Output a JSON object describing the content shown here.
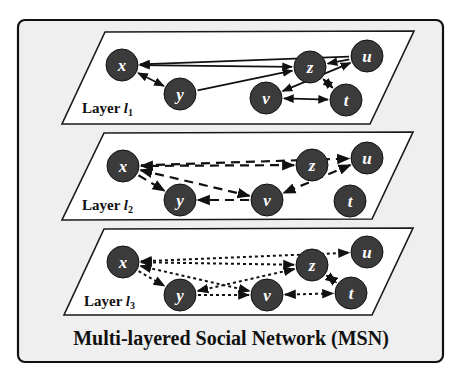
{
  "title": "Multi-layered Social Network (MSN)",
  "colors": {
    "node_fill": "#3b3b3b",
    "frame_fill": "#efefef",
    "plane_fill": "#ffffff",
    "stroke": "#111111"
  },
  "layers": [
    {
      "label_prefix": "Layer ",
      "label_var": "l",
      "label_sub": "1",
      "line_style": "solid",
      "plane": [
        [
          105,
          32
        ],
        [
          414,
          31
        ],
        [
          370,
          124
        ],
        [
          62,
          124
        ]
      ],
      "label_pos": [
        82,
        113
      ],
      "nodes": [
        {
          "id": "x",
          "cx": 122,
          "cy": 65
        },
        {
          "id": "y",
          "cx": 180,
          "cy": 94
        },
        {
          "id": "z",
          "cx": 310,
          "cy": 67
        },
        {
          "id": "u",
          "cx": 367,
          "cy": 56
        },
        {
          "id": "v",
          "cx": 266,
          "cy": 98
        },
        {
          "id": "t",
          "cx": 346,
          "cy": 100
        }
      ],
      "edges": [
        {
          "from": "u",
          "to": "x",
          "dir": "to"
        },
        {
          "from": "x",
          "to": "z",
          "dir": "both"
        },
        {
          "from": "x",
          "to": "y",
          "dir": "both"
        },
        {
          "from": "y",
          "to": "z",
          "dir": "to"
        },
        {
          "from": "u",
          "to": "z",
          "dir": "to"
        },
        {
          "from": "z",
          "to": "t",
          "dir": "both"
        },
        {
          "from": "v",
          "to": "u",
          "dir": "both"
        },
        {
          "from": "v",
          "to": "t",
          "dir": "both"
        }
      ]
    },
    {
      "label_prefix": "Layer ",
      "label_var": "l",
      "label_sub": "2",
      "line_style": "dashed",
      "plane": [
        [
          104,
          133
        ],
        [
          413,
          132
        ],
        [
          372,
          219
        ],
        [
          62,
          220
        ]
      ],
      "label_pos": [
        82,
        210
      ],
      "nodes": [
        {
          "id": "x",
          "cx": 123,
          "cy": 166
        },
        {
          "id": "y",
          "cx": 180,
          "cy": 200
        },
        {
          "id": "z",
          "cx": 312,
          "cy": 165
        },
        {
          "id": "u",
          "cx": 367,
          "cy": 158
        },
        {
          "id": "v",
          "cx": 267,
          "cy": 200
        },
        {
          "id": "t",
          "cx": 350,
          "cy": 201
        }
      ],
      "edges": [
        {
          "from": "x",
          "to": "u",
          "dir": "to"
        },
        {
          "from": "z",
          "to": "x",
          "dir": "both"
        },
        {
          "from": "x",
          "to": "v",
          "dir": "both"
        },
        {
          "from": "x",
          "to": "y",
          "dir": "to"
        },
        {
          "from": "v",
          "to": "y",
          "dir": "to"
        },
        {
          "from": "u",
          "to": "v",
          "dir": "both"
        }
      ]
    },
    {
      "label_prefix": "Layer ",
      "label_var": "l",
      "label_sub": "3",
      "line_style": "dotted",
      "plane": [
        [
          104,
          229
        ],
        [
          413,
          228
        ],
        [
          372,
          315
        ],
        [
          64,
          315
        ]
      ],
      "label_pos": [
        84,
        306
      ],
      "nodes": [
        {
          "id": "x",
          "cx": 123,
          "cy": 262
        },
        {
          "id": "y",
          "cx": 180,
          "cy": 295
        },
        {
          "id": "z",
          "cx": 312,
          "cy": 265
        },
        {
          "id": "u",
          "cx": 367,
          "cy": 252
        },
        {
          "id": "v",
          "cx": 267,
          "cy": 295
        },
        {
          "id": "t",
          "cx": 351,
          "cy": 293
        }
      ],
      "edges": [
        {
          "from": "x",
          "to": "u",
          "dir": "both"
        },
        {
          "from": "x",
          "to": "z",
          "dir": "both"
        },
        {
          "from": "x",
          "to": "v",
          "dir": "both"
        },
        {
          "from": "z",
          "to": "y",
          "dir": "both"
        },
        {
          "from": "x",
          "to": "y",
          "dir": "to"
        },
        {
          "from": "y",
          "to": "v",
          "dir": "to"
        },
        {
          "from": "z",
          "to": "t",
          "dir": "both"
        },
        {
          "from": "v",
          "to": "t",
          "dir": "both"
        }
      ]
    }
  ]
}
